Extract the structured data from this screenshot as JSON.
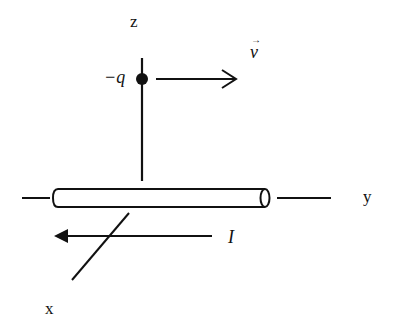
{
  "diagram": {
    "colors": {
      "ink": "#111111",
      "background": "#ffffff",
      "pipe_fill": "#ffffff"
    },
    "axes": {
      "z": {
        "label": "z"
      },
      "y": {
        "label": "y"
      },
      "x": {
        "label": "x"
      }
    },
    "charge": {
      "label": "−q"
    },
    "velocity": {
      "label": "v",
      "vector_mark": "→"
    },
    "current": {
      "label": "I"
    }
  }
}
